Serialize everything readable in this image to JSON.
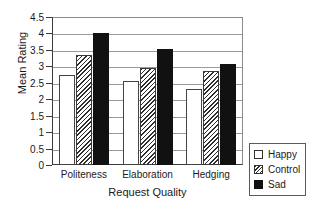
{
  "chart_data": {
    "type": "bar",
    "title": "",
    "xlabel": "Request Quality",
    "ylabel": "Mean Rating",
    "categories": [
      "Politeness",
      "Elaboration",
      "Hedging"
    ],
    "series": [
      {
        "name": "Happy",
        "values": [
          2.75,
          2.55,
          2.3
        ]
      },
      {
        "name": "Control",
        "values": [
          3.35,
          2.95,
          2.85
        ]
      },
      {
        "name": "Sad",
        "values": [
          4.0,
          3.52,
          3.07
        ]
      }
    ],
    "ylim": [
      0,
      4.5
    ],
    "ytick_labels": [
      "4.5",
      "4",
      "3.5",
      "3",
      "2.5",
      "2",
      "1.5",
      "1",
      "0.5",
      "0"
    ],
    "ytick_values": [
      4.5,
      4,
      3.5,
      3,
      2.5,
      2,
      1.5,
      1,
      0.5,
      0
    ],
    "grid": true,
    "legend_position": "bottom-right",
    "colors": {
      "happy": "#ffffff",
      "control": "#ffffff",
      "sad": "#111111",
      "axis": "#3a3a3a",
      "grid": "#9a9a9a"
    }
  },
  "axes": {
    "y_title": "Mean Rating",
    "x_title": "Request Quality"
  },
  "legend": {
    "entries": [
      {
        "label": "Happy",
        "style": "happy"
      },
      {
        "label": "Control",
        "style": "control"
      },
      {
        "label": "Sad",
        "style": "sad"
      }
    ]
  }
}
